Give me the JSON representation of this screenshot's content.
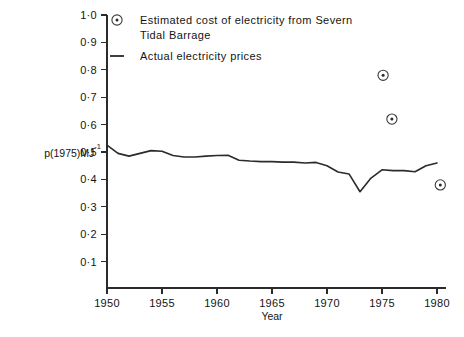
{
  "chart_data": {
    "type": "line",
    "title": "",
    "xlabel": "Year",
    "ylabel": "p(1975)MJ",
    "ylabel_exponent": "-1",
    "xlim": [
      1950,
      1980
    ],
    "ylim": [
      0,
      1.0
    ],
    "grid": false,
    "legend_position": "top-left-inside",
    "xticks": [
      1950,
      1955,
      1960,
      1965,
      1970,
      1975,
      1980
    ],
    "xtick_labels": [
      "1950",
      "1955",
      "1960",
      "1965",
      "1970",
      "1975",
      "1980"
    ],
    "yticks": [
      0.1,
      0.2,
      0.3,
      0.4,
      0.5,
      0.6,
      0.7,
      0.8,
      0.9,
      1.0
    ],
    "ytick_labels": [
      "0·1",
      "0·2",
      "0·3",
      "0·4",
      "0·5",
      "0·6",
      "0·7",
      "0·8",
      "0·9",
      "1·0"
    ],
    "series": [
      {
        "name": "Actual electricity prices",
        "marker": "line",
        "x": [
          1950,
          1951,
          1952,
          1953,
          1954,
          1955,
          1956,
          1957,
          1958,
          1959,
          1960,
          1961,
          1962,
          1963,
          1964,
          1965,
          1966,
          1967,
          1968,
          1969,
          1970,
          1971,
          1972,
          1973,
          1974,
          1975,
          1976,
          1977,
          1978,
          1979,
          1980
        ],
        "values": [
          0.525,
          0.495,
          0.485,
          0.495,
          0.505,
          0.503,
          0.487,
          0.482,
          0.482,
          0.485,
          0.487,
          0.488,
          0.47,
          0.467,
          0.465,
          0.465,
          0.463,
          0.463,
          0.46,
          0.462,
          0.45,
          0.427,
          0.42,
          0.355,
          0.405,
          0.435,
          0.432,
          0.432,
          0.428,
          0.45,
          0.46
        ]
      },
      {
        "name": "Estimated cost of electricity from Severn Tidal Barrage",
        "marker": "circle-dot",
        "x": [
          1975.1,
          1975.9,
          1980.3
        ],
        "values": [
          0.78,
          0.62,
          0.38
        ]
      }
    ],
    "legend": [
      {
        "symbol": "circle-dot",
        "lines": [
          "Estimated cost of electricity from Severn",
          "Tidal Barrage"
        ]
      },
      {
        "symbol": "line",
        "lines": [
          "Actual electricity prices"
        ]
      }
    ],
    "colors": {
      "line": "#2b2b2b",
      "marker": "#3a3a3a",
      "axis": "#2b2b2b",
      "text": "#141414",
      "background": "#ffffff"
    }
  }
}
